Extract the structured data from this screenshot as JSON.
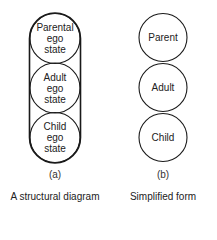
{
  "diagram_a": {
    "states": [
      {
        "line1": "Parental",
        "line2": "ego",
        "line3": "state"
      },
      {
        "line1": "Adult",
        "line2": "ego",
        "line3": "state"
      },
      {
        "line1": "Child",
        "line2": "ego",
        "line3": "state"
      }
    ],
    "sublabel": "(a)",
    "caption": "A structural diagram"
  },
  "diagram_b": {
    "states": [
      {
        "label": "Parent"
      },
      {
        "label": "Adult"
      },
      {
        "label": "Child"
      }
    ],
    "sublabel": "(b)",
    "caption": "Simplified form"
  },
  "colors": {
    "stroke": "#1a1a1a",
    "background": "#ffffff"
  }
}
